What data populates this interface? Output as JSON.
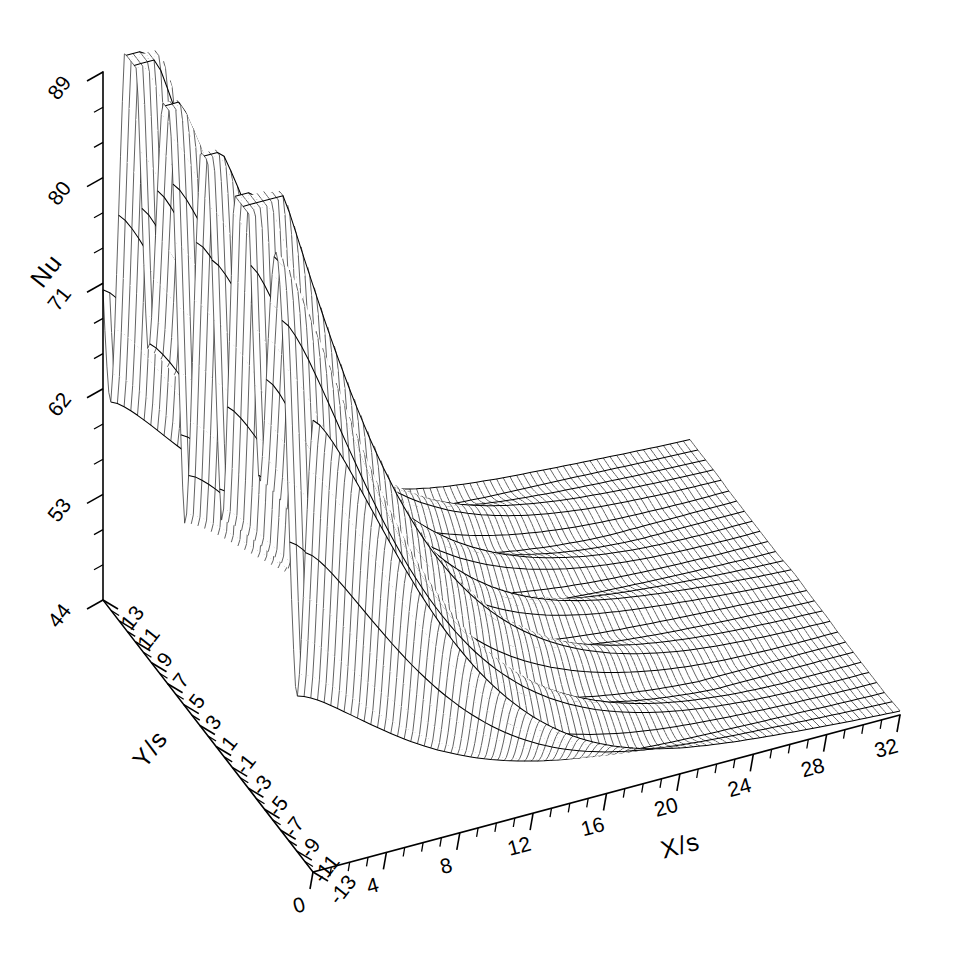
{
  "figure": {
    "type": "surface-3d-wireframe",
    "background_color": "#ffffff",
    "line_color": "#000000",
    "title": ""
  },
  "axes": {
    "x": {
      "title": "X/s",
      "tick_labels": [
        "0",
        "4",
        "8",
        "12",
        "16",
        "20",
        "24",
        "28",
        "32"
      ],
      "min": 0,
      "max": 32,
      "major_step": 4,
      "minor_per_major": 4
    },
    "y": {
      "title": "Y/s",
      "tick_labels": [
        "13",
        "11",
        "9",
        "7",
        "5",
        "3",
        "1",
        "-1",
        "-3",
        "-5",
        "-7",
        "-9",
        "-11",
        "-13"
      ],
      "min": -13,
      "max": 13,
      "major_step": 2,
      "minor_per_major": 2
    },
    "z": {
      "title": "Nu",
      "tick_labels": [
        "89",
        "80",
        "71",
        "62",
        "53",
        "44"
      ],
      "min": 44,
      "max": 89,
      "major_step": 9,
      "minor_per_major": 3
    }
  },
  "chart_data": {
    "type": "surface",
    "title": "",
    "xlabel": "X/s",
    "ylabel": "Y/s",
    "zlabel": "Nu",
    "xlim": [
      0,
      32
    ],
    "ylim": [
      -13,
      13
    ],
    "zlim": [
      44,
      89
    ],
    "grid": false,
    "legend": "none",
    "x_tick_values": [
      0,
      4,
      8,
      12,
      16,
      20,
      24,
      28,
      32
    ],
    "y_tick_values": [
      13,
      11,
      9,
      7,
      5,
      3,
      1,
      -1,
      -3,
      -5,
      -7,
      -9,
      -11,
      -13
    ],
    "z_tick_values": [
      89,
      80,
      71,
      62,
      53,
      44
    ],
    "grid_nx": 88,
    "grid_ny": 27,
    "surface_model": {
      "base_decay": "Nu(X,Y) = 44 + A(X) * R(Y,X)",
      "A_amplitude_at_x0": 44.0,
      "decay_length_s": 7.4,
      "lobe_count": 6,
      "lobe_wavelength_y_s": 4.6
    },
    "notable_features": [
      {
        "name": "back ridge peak",
        "x": 3.2,
        "y": 9.0,
        "z": 88
      },
      {
        "name": "secondary ridge",
        "x": 4.8,
        "y": 4.0,
        "z": 84
      },
      {
        "name": "central saddle",
        "x": 6.5,
        "y": 1.0,
        "z": 72
      },
      {
        "name": "front lobe peak",
        "x": 2.0,
        "y": -6.0,
        "z": 86
      },
      {
        "name": "downstream plateau",
        "x": 28.0,
        "y": 0.0,
        "z": 46
      }
    ]
  }
}
